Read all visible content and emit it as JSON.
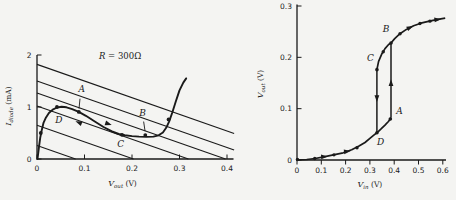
{
  "colors": {
    "ink": "#1a1a1a",
    "background": "#f4f4f2"
  },
  "chart_data": [
    {
      "type": "line",
      "id": "left",
      "title": {
        "var": "R",
        "rest": "= 300Ω"
      },
      "xlabel": {
        "base": "V",
        "sub": "out",
        "unit": "(V)"
      },
      "ylabel": {
        "base": "I",
        "sub": "diode",
        "unit": "(mA)"
      },
      "xlim": [
        0,
        0.42
      ],
      "ylim": [
        0,
        2
      ],
      "xticks": [
        {
          "v": 0,
          "label": "0"
        },
        {
          "v": 0.1,
          "label": "0.1"
        },
        {
          "v": 0.2,
          "label": "0.2"
        },
        {
          "v": 0.3,
          "label": "0.3"
        },
        {
          "v": 0.4,
          "label": "0.4"
        }
      ],
      "yticks": [
        {
          "v": 0,
          "label": "0"
        },
        {
          "v": 1,
          "label": "1"
        },
        {
          "v": 2,
          "label": "2"
        }
      ],
      "load_lines": {
        "slope": -3.2,
        "intercepts": [
          1.82,
          1.5,
          1.27,
          1.02,
          0.65,
          0.26
        ]
      },
      "diode_curve": [
        [
          0.001,
          0.0
        ],
        [
          0.004,
          0.22
        ],
        [
          0.007,
          0.42
        ],
        [
          0.01,
          0.56
        ],
        [
          0.014,
          0.7
        ],
        [
          0.019,
          0.8
        ],
        [
          0.025,
          0.885
        ],
        [
          0.033,
          0.95
        ],
        [
          0.042,
          0.99
        ],
        [
          0.052,
          1.005
        ],
        [
          0.062,
          0.995
        ],
        [
          0.074,
          0.96
        ],
        [
          0.088,
          0.905
        ],
        [
          0.103,
          0.83
        ],
        [
          0.12,
          0.73
        ],
        [
          0.14,
          0.615
        ],
        [
          0.158,
          0.53
        ],
        [
          0.172,
          0.48
        ],
        [
          0.185,
          0.455
        ],
        [
          0.2,
          0.44
        ],
        [
          0.215,
          0.43
        ],
        [
          0.23,
          0.425
        ],
        [
          0.245,
          0.43
        ],
        [
          0.256,
          0.455
        ],
        [
          0.265,
          0.51
        ],
        [
          0.272,
          0.6
        ],
        [
          0.278,
          0.72
        ],
        [
          0.285,
          0.9
        ],
        [
          0.292,
          1.1
        ],
        [
          0.3,
          1.32
        ],
        [
          0.308,
          1.47
        ],
        [
          0.314,
          1.55
        ]
      ],
      "points": [
        {
          "label": "A",
          "x": 0.088,
          "y": 0.905,
          "lx": 0.094,
          "ly": 1.28,
          "leader": [
            [
              0.0905,
              1.16
            ],
            [
              0.0885,
              0.97
            ]
          ]
        },
        {
          "label": "B",
          "x": 0.228,
          "y": 0.46,
          "lx": 0.222,
          "ly": 0.82,
          "leader": [
            [
              0.2245,
              0.72
            ],
            [
              0.2275,
              0.535
            ]
          ]
        },
        {
          "label": "C",
          "x": 0.179,
          "y": 0.465,
          "lx": 0.176,
          "ly": 0.225
        },
        {
          "label": "D",
          "x": 0.042,
          "y": 1.0,
          "lx": 0.046,
          "ly": 0.7
        }
      ],
      "extra_dots": [
        [
          0.008,
          0.5
        ],
        [
          0.277,
          0.76
        ]
      ],
      "arrows": [
        {
          "x": 0.15,
          "y": 0.675,
          "a": 19
        },
        {
          "x": 0.088,
          "y": 0.7,
          "a": -158
        }
      ]
    },
    {
      "type": "line",
      "id": "right",
      "xlabel": {
        "base": "V",
        "sub": "in",
        "unit": "(V)"
      },
      "ylabel": {
        "base": "V",
        "sub": "out",
        "unit": "(V)"
      },
      "xlim": [
        0,
        0.62
      ],
      "ylim": [
        0,
        0.3
      ],
      "xticks": [
        {
          "v": 0,
          "label": "0"
        },
        {
          "v": 0.1,
          "label": "0.1"
        },
        {
          "v": 0.2,
          "label": "0.2"
        },
        {
          "v": 0.3,
          "label": "0.3"
        },
        {
          "v": 0.4,
          "label": "0.4"
        },
        {
          "v": 0.5,
          "label": "0.5"
        },
        {
          "v": 0.6,
          "label": "0.6"
        }
      ],
      "yticks": [
        {
          "v": 0,
          "label": "0"
        },
        {
          "v": 0.1,
          "label": "0.1"
        },
        {
          "v": 0.2,
          "label": "0.2"
        },
        {
          "v": 0.3,
          "label": "0.3"
        }
      ],
      "branches": {
        "lower": [
          [
            0,
            0
          ],
          [
            0.04,
            0.001
          ],
          [
            0.075,
            0.003
          ],
          [
            0.11,
            0.006
          ],
          [
            0.15,
            0.01
          ],
          [
            0.19,
            0.014
          ],
          [
            0.225,
            0.02
          ],
          [
            0.255,
            0.027
          ],
          [
            0.28,
            0.034
          ],
          [
            0.3,
            0.042
          ],
          [
            0.315,
            0.048
          ],
          [
            0.329,
            0.053
          ],
          [
            0.345,
            0.06
          ],
          [
            0.362,
            0.068
          ],
          [
            0.376,
            0.075
          ],
          [
            0.384,
            0.08
          ],
          [
            0.387,
            0.083
          ]
        ],
        "up_jump": [
          [
            0.387,
            0.083
          ],
          [
            0.387,
            0.228
          ]
        ],
        "upper": [
          [
            0.329,
            0.176
          ],
          [
            0.336,
            0.192
          ],
          [
            0.348,
            0.206
          ],
          [
            0.362,
            0.217
          ],
          [
            0.377,
            0.225
          ],
          [
            0.387,
            0.228
          ],
          [
            0.402,
            0.2365
          ],
          [
            0.424,
            0.246
          ],
          [
            0.45,
            0.2545
          ],
          [
            0.48,
            0.2615
          ],
          [
            0.51,
            0.2665
          ],
          [
            0.545,
            0.2705
          ],
          [
            0.58,
            0.274
          ],
          [
            0.61,
            0.2765
          ]
        ],
        "down_jump": [
          [
            0.329,
            0.176
          ],
          [
            0.329,
            0.053
          ]
        ]
      },
      "points": [
        {
          "label": "A",
          "x": 0.384,
          "y": 0.08,
          "lx": 0.408,
          "ly": 0.09,
          "anchor": "start"
        },
        {
          "label": "B",
          "x": 0.387,
          "y": 0.228,
          "lx": 0.366,
          "ly": 0.25,
          "anchor": "middle"
        },
        {
          "label": "C",
          "x": 0.329,
          "y": 0.176,
          "lx": 0.302,
          "ly": 0.193,
          "anchor": "middle"
        },
        {
          "label": "D",
          "x": 0.329,
          "y": 0.053,
          "lx": 0.344,
          "ly": 0.03,
          "anchor": "middle"
        }
      ],
      "extra_dots": [
        [
          0.002,
          0.001
        ],
        [
          0.073,
          0.003
        ],
        [
          0.152,
          0.01
        ],
        [
          0.247,
          0.024
        ],
        [
          0.355,
          0.211
        ],
        [
          0.424,
          0.246
        ],
        [
          0.506,
          0.266
        ],
        [
          0.547,
          0.2705
        ]
      ],
      "arrows": [
        {
          "x": 0.112,
          "y": 0.0065,
          "a": -4
        },
        {
          "x": 0.206,
          "y": 0.0165,
          "a": -6
        },
        {
          "x": 0.387,
          "y": 0.15,
          "a": -90
        },
        {
          "x": 0.329,
          "y": 0.12,
          "a": 90
        },
        {
          "x": 0.465,
          "y": 0.258,
          "a": -25
        },
        {
          "x": 0.578,
          "y": 0.2735,
          "a": -7
        }
      ]
    }
  ]
}
